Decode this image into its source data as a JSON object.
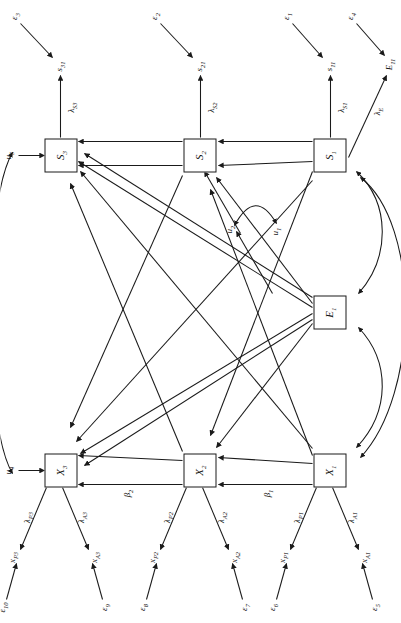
{
  "figure": {
    "type": "sem-path-diagram",
    "orientation": "rotated-90-ccw",
    "background": "#ffffff",
    "stroke": "#1a1a1a"
  },
  "latent_nodes": [
    {
      "id": "X1",
      "label": "X",
      "sub": "1"
    },
    {
      "id": "X2",
      "label": "X",
      "sub": "2"
    },
    {
      "id": "X3",
      "label": "X",
      "sub": "3"
    },
    {
      "id": "E1",
      "label": "E",
      "sub": "1"
    },
    {
      "id": "S1",
      "label": "S",
      "sub": "1"
    },
    {
      "id": "S2",
      "label": "S",
      "sub": "2"
    },
    {
      "id": "S3",
      "label": "S",
      "sub": "3"
    }
  ],
  "indicators": [
    {
      "id": "xA1",
      "label": "x",
      "sub": "A1"
    },
    {
      "id": "xP1",
      "label": "x",
      "sub": "P1"
    },
    {
      "id": "xA2",
      "label": "x",
      "sub": "A2"
    },
    {
      "id": "xP2",
      "label": "x",
      "sub": "P2"
    },
    {
      "id": "xA3",
      "label": "x",
      "sub": "A3"
    },
    {
      "id": "xP3",
      "label": "x",
      "sub": "P3"
    },
    {
      "id": "s11",
      "label": "s",
      "sub": "11"
    },
    {
      "id": "s21",
      "label": "s",
      "sub": "21"
    },
    {
      "id": "s31",
      "label": "s",
      "sub": "31"
    },
    {
      "id": "E11",
      "label": "E",
      "sub": "11"
    }
  ],
  "errors": [
    {
      "id": "e1",
      "label": "ε",
      "sub": "1"
    },
    {
      "id": "e2",
      "label": "ε",
      "sub": "2"
    },
    {
      "id": "e3",
      "label": "ε",
      "sub": "3"
    },
    {
      "id": "e4",
      "label": "ε",
      "sub": "4"
    },
    {
      "id": "e5",
      "label": "ε",
      "sub": "5"
    },
    {
      "id": "e6",
      "label": "ε",
      "sub": "6"
    },
    {
      "id": "e7",
      "label": "ε",
      "sub": "7"
    },
    {
      "id": "e8",
      "label": "ε",
      "sub": "8"
    },
    {
      "id": "e9",
      "label": "ε",
      "sub": "9"
    },
    {
      "id": "e10",
      "label": "ε",
      "sub": "10"
    }
  ],
  "disturbances": [
    {
      "id": "u1",
      "label": "u",
      "sub": "1"
    },
    {
      "id": "u2",
      "label": "u",
      "sub": "2"
    },
    {
      "id": "u4",
      "label": "u",
      "sub": "4"
    },
    {
      "id": "u5",
      "label": "u",
      "sub": "5"
    }
  ],
  "loadings": [
    {
      "id": "lA1",
      "label": "λ",
      "sub": "A1"
    },
    {
      "id": "lP1",
      "label": "λ",
      "sub": "P1"
    },
    {
      "id": "lA2",
      "label": "λ",
      "sub": "A2"
    },
    {
      "id": "lP2",
      "label": "λ",
      "sub": "P2"
    },
    {
      "id": "lA3",
      "label": "λ",
      "sub": "A3"
    },
    {
      "id": "lP3",
      "label": "λ",
      "sub": "P3"
    },
    {
      "id": "lS1",
      "label": "λ",
      "sub": "S1"
    },
    {
      "id": "lS2",
      "label": "λ",
      "sub": "S2"
    },
    {
      "id": "lS3",
      "label": "λ",
      "sub": "S3"
    },
    {
      "id": "lE",
      "label": "λ",
      "sub": "E"
    }
  ],
  "paths": [
    {
      "id": "b1",
      "label": "β",
      "sub": "1"
    },
    {
      "id": "b2",
      "label": "β",
      "sub": "2"
    }
  ],
  "correlations": [
    {
      "from": "X1",
      "to": "E1",
      "style": "double-headed-curve"
    },
    {
      "from": "E1",
      "to": "S1",
      "style": "double-headed-curve"
    },
    {
      "from": "X1",
      "to": "S1",
      "style": "double-headed-curve"
    },
    {
      "from": "u4",
      "to": "u5",
      "style": "double-headed-arc"
    },
    {
      "from": "u1",
      "to": "u2",
      "style": "double-headed-arc"
    }
  ]
}
